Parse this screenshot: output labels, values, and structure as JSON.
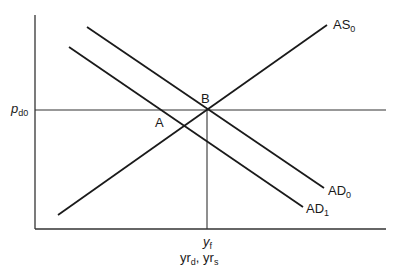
{
  "diagram": {
    "type": "aggregate-demand-aggregate-supply",
    "colors": {
      "background": "#ffffff",
      "line": "#1a1a1a",
      "axis": "#333333"
    },
    "axes": {
      "x_origin": [
        35,
        229
      ],
      "x_end": [
        386,
        229
      ],
      "y_top": [
        35,
        15
      ]
    },
    "curves": [
      {
        "id": "AS0",
        "label_main": "AS",
        "label_sub": "0",
        "from": [
          58,
          215
        ],
        "to": [
          327,
          25
        ]
      },
      {
        "id": "AD0",
        "label_main": "AD",
        "label_sub": "0",
        "from": [
          87,
          27
        ],
        "to": [
          324,
          188
        ]
      },
      {
        "id": "AD1",
        "label_main": "AD",
        "label_sub": "1",
        "from": [
          69,
          47
        ],
        "to": [
          303,
          207
        ]
      }
    ],
    "reference_lines": {
      "price_level": {
        "from": [
          35,
          110
        ],
        "to": [
          386,
          110
        ]
      },
      "full_employment_output": {
        "from": [
          207,
          110
        ],
        "to": [
          207,
          229
        ]
      }
    },
    "points": {
      "A": {
        "label": "A"
      },
      "B": {
        "label": "B"
      }
    },
    "labels": {
      "price_main": "p",
      "price_sub": "d0",
      "as0_main": "AS",
      "as0_sub": "0",
      "ad0_main": "AD",
      "ad0_sub": "0",
      "ad1_main": "AD",
      "ad1_sub": "1",
      "point_a": "A",
      "point_b": "B",
      "yf_main": "y",
      "yf_sub": "f",
      "xaxis_part1_main": "yr",
      "xaxis_part1_sub": "d",
      "xaxis_sep": ", ",
      "xaxis_part2_main": "yr",
      "xaxis_part2_sub": "s"
    }
  }
}
